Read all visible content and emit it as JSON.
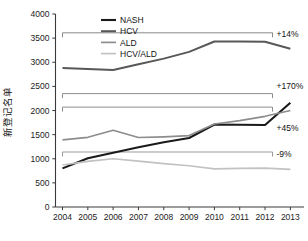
{
  "chart_data": {
    "type": "line",
    "title": "",
    "xlabel": "",
    "ylabel": "新登记名单",
    "categories": [
      "2004",
      "2005",
      "2006",
      "2007",
      "2008",
      "2009",
      "2010",
      "2011",
      "2012",
      "2013"
    ],
    "x": [
      2004,
      2005,
      2006,
      2007,
      2008,
      2009,
      2010,
      2011,
      2012,
      2013
    ],
    "ylim": [
      0,
      4000
    ],
    "yticks": [
      0,
      500,
      1000,
      1500,
      2000,
      2500,
      3000,
      3500,
      4000
    ],
    "ytick_labels": [
      "0",
      "500",
      "1000",
      "1500",
      "2000",
      "2500",
      "3000",
      "3500",
      "4000"
    ],
    "grid": false,
    "legend_position": "top-left",
    "series": [
      {
        "name": "NASH",
        "color": "#1a1a1a",
        "width": 2.1,
        "values": [
          800,
          1010,
          1125,
          1240,
          1340,
          1430,
          1710,
          1705,
          1700,
          2160
        ]
      },
      {
        "name": "HCV",
        "color": "#585858",
        "width": 2.0,
        "values": [
          2880,
          2860,
          2840,
          2960,
          3075,
          3215,
          3430,
          3430,
          3425,
          3280
        ]
      },
      {
        "name": "ALD",
        "color": "#8d8d8d",
        "width": 1.7,
        "values": [
          1390,
          1445,
          1590,
          1440,
          1455,
          1480,
          1720,
          1790,
          1880,
          2000
        ]
      },
      {
        "name": "HCV/ALD",
        "color": "#c2c2c2",
        "width": 1.7,
        "values": [
          870,
          945,
          1000,
          950,
          900,
          855,
          790,
          800,
          805,
          780
        ]
      }
    ],
    "annotations": [
      {
        "label": "+14%",
        "series": "HCV",
        "bracket_value": 3610,
        "label_y_value": 3595,
        "color": "#888888"
      },
      {
        "label": "+170%",
        "series": "NASH",
        "bracket_value": 2350,
        "label_y_value": 2515,
        "color": "#8d8d8d"
      },
      {
        "label": "+45%",
        "series": "ALD",
        "bracket_value": 2070,
        "label_y_value": 1640,
        "color": "#8d8d8d"
      },
      {
        "label": "-9%",
        "series": "HCV/ALD",
        "bracket_value": 1140,
        "label_y_value": 1090,
        "color": "#9a9a9a"
      }
    ]
  },
  "legend": {
    "items": [
      {
        "label": "NASH"
      },
      {
        "label": "HCV"
      },
      {
        "label": "ALD"
      },
      {
        "label": "HCV/ALD"
      }
    ]
  }
}
